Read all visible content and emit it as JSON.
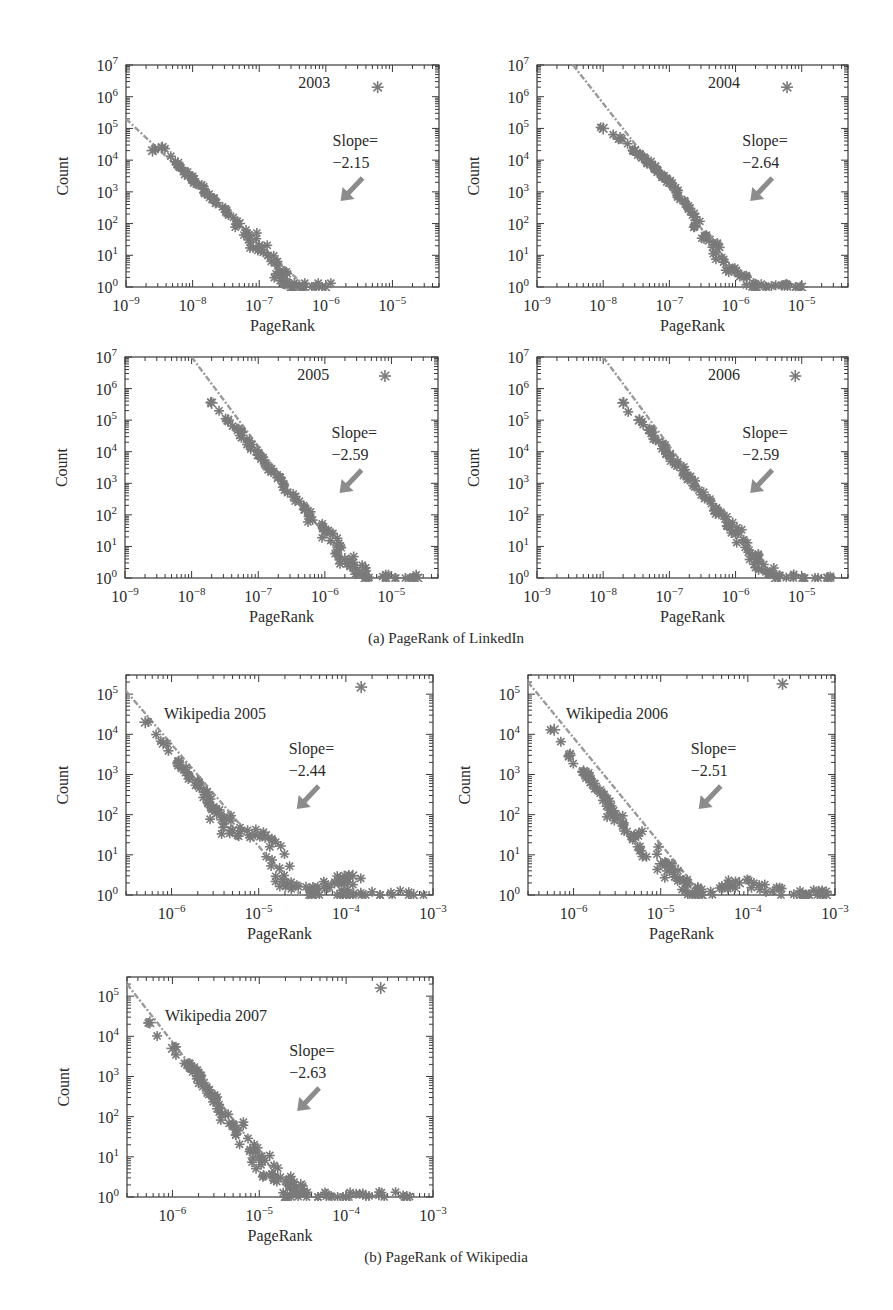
{
  "figure": {
    "captions": {
      "a": "(a) PageRank of LinkedIn",
      "b": "(b) PageRank of Wikipedia"
    },
    "colors": {
      "marker": "#7a7a7a",
      "fit_line": "#9a9a9a",
      "arrow": "#8c8c8c",
      "axis": "#3a3a3a",
      "text": "#2a2a2a"
    }
  },
  "chart_data": [
    {
      "type": "scatter",
      "title": "2003",
      "group": "LinkedIn",
      "xlabel": "PageRank",
      "ylabel": "Count",
      "xscale": "log",
      "yscale": "log",
      "xlim": [
        1e-09,
        5e-05
      ],
      "ylim": [
        1,
        10000000.0
      ],
      "xticks": [
        "10^-9",
        "10^-8",
        "10^-7",
        "10^-6",
        "10^-5"
      ],
      "yticks": [
        "10^0",
        "10^1",
        "10^2",
        "10^3",
        "10^4",
        "10^5",
        "10^6",
        "10^7"
      ],
      "annotation": {
        "label": "Slope=",
        "value": "−2.15"
      },
      "slope": -2.15,
      "fit_line": {
        "x0": 1e-09,
        "y0": 200000.0,
        "x1": 5e-07,
        "y1": 1
      },
      "outlier": {
        "x": 6e-06,
        "y": 2000000.0
      },
      "points": [
        [
          2.5e-09,
          20000.0
        ],
        [
          3.5e-09,
          25000.0
        ],
        [
          6e-09,
          8000.0
        ],
        [
          1e-08,
          2500.0
        ],
        [
          2e-08,
          600.0
        ],
        [
          5e-08,
          100.0
        ],
        [
          1e-07,
          20.0
        ],
        [
          2e-07,
          3
        ],
        [
          3e-07,
          1
        ],
        [
          1e-06,
          1
        ]
      ]
    },
    {
      "type": "scatter",
      "title": "2004",
      "group": "LinkedIn",
      "xlabel": "PageRank",
      "ylabel": "Count",
      "xscale": "log",
      "yscale": "log",
      "xlim": [
        1e-09,
        5e-05
      ],
      "ylim": [
        1,
        10000000.0
      ],
      "xticks": [
        "10^-9",
        "10^-8",
        "10^-7",
        "10^-6",
        "10^-5"
      ],
      "yticks": [
        "10^0",
        "10^1",
        "10^2",
        "10^3",
        "10^4",
        "10^5",
        "10^6",
        "10^7"
      ],
      "annotation": {
        "label": "Slope=",
        "value": "−2.64"
      },
      "slope": -2.64,
      "fit_line": {
        "x0": 3.5e-09,
        "y0": 10000000.0,
        "x1": 1.5e-06,
        "y1": 1
      },
      "outlier": {
        "x": 6e-06,
        "y": 2000000.0
      },
      "points": [
        [
          1e-08,
          100000.0
        ],
        [
          1.8e-08,
          50000.0
        ],
        [
          3e-08,
          20000.0
        ],
        [
          6e-08,
          6000.0
        ],
        [
          1e-07,
          2000.0
        ],
        [
          2e-07,
          300.0
        ],
        [
          4e-07,
          30.0
        ],
        [
          8e-07,
          4
        ],
        [
          2e-06,
          1
        ],
        [
          1e-05,
          1
        ]
      ]
    },
    {
      "type": "scatter",
      "title": "2005",
      "group": "LinkedIn",
      "xlabel": "PageRank",
      "ylabel": "Count",
      "xscale": "log",
      "yscale": "log",
      "xlim": [
        1e-09,
        5e-05
      ],
      "ylim": [
        1,
        10000000.0
      ],
      "xticks": [
        "10^-9",
        "10^-8",
        "10^-7",
        "10^-6",
        "10^-5"
      ],
      "yticks": [
        "10^0",
        "10^1",
        "10^2",
        "10^3",
        "10^4",
        "10^5",
        "10^6",
        "10^7"
      ],
      "annotation": {
        "label": "Slope=",
        "value": "−2.59"
      },
      "slope": -2.59,
      "fit_line": {
        "x0": 1e-08,
        "y0": 10000000.0,
        "x1": 3e-06,
        "y1": 1
      },
      "outlier": {
        "x": 8e-06,
        "y": 2500000.0
      },
      "points": [
        [
          2e-08,
          350000.0
        ],
        [
          3.5e-08,
          100000.0
        ],
        [
          5e-08,
          50000.0
        ],
        [
          1e-07,
          8000.0
        ],
        [
          2e-07,
          1500.0
        ],
        [
          5e-07,
          150.0
        ],
        [
          1e-06,
          30.0
        ],
        [
          2e-06,
          4
        ],
        [
          4e-06,
          1
        ],
        [
          2.5e-05,
          1
        ]
      ]
    },
    {
      "type": "scatter",
      "title": "2006",
      "group": "LinkedIn",
      "xlabel": "PageRank",
      "ylabel": "Count",
      "xscale": "log",
      "yscale": "log",
      "xlim": [
        1e-09,
        5e-05
      ],
      "ylim": [
        1,
        10000000.0
      ],
      "xticks": [
        "10^-9",
        "10^-8",
        "10^-7",
        "10^-6",
        "10^-5"
      ],
      "yticks": [
        "10^0",
        "10^1",
        "10^2",
        "10^3",
        "10^4",
        "10^5",
        "10^6",
        "10^7"
      ],
      "annotation": {
        "label": "Slope=",
        "value": "−2.59"
      },
      "slope": -2.59,
      "fit_line": {
        "x0": 1e-08,
        "y0": 10000000.0,
        "x1": 3e-06,
        "y1": 1
      },
      "outlier": {
        "x": 8e-06,
        "y": 2500000.0
      },
      "points": [
        [
          2e-08,
          350000.0
        ],
        [
          3.5e-08,
          100000.0
        ],
        [
          5e-08,
          50000.0
        ],
        [
          1e-07,
          8000.0
        ],
        [
          2e-07,
          1500.0
        ],
        [
          5e-07,
          150.0
        ],
        [
          1e-06,
          30.0
        ],
        [
          2e-06,
          4
        ],
        [
          4e-06,
          1
        ],
        [
          2.5e-05,
          1
        ]
      ]
    },
    {
      "type": "scatter",
      "title": "Wikipedia 2005",
      "group": "Wikipedia",
      "xlabel": "PageRank",
      "ylabel": "Count",
      "xscale": "log",
      "yscale": "log",
      "xlim": [
        3e-07,
        0.001
      ],
      "ylim": [
        1,
        300000.0
      ],
      "xticks": [
        "10^-6",
        "10^-5",
        "10^-4",
        "10^-3"
      ],
      "yticks": [
        "10^0",
        "10^1",
        "10^2",
        "10^3",
        "10^4",
        "10^5"
      ],
      "annotation": {
        "label": "Slope=",
        "value": "−2.44"
      },
      "slope": -2.44,
      "fit_line": {
        "x0": 3e-07,
        "y0": 120000.0,
        "x1": 3e-05,
        "y1": 1
      },
      "outlier": {
        "x": 0.00015,
        "y": 150000.0
      },
      "points": [
        [
          5e-07,
          20000.0
        ],
        [
          8e-07,
          6000.0
        ],
        [
          1.2e-06,
          2000.0
        ],
        [
          2e-06,
          600.0
        ],
        [
          3e-06,
          150.0
        ],
        [
          5e-06,
          40.0
        ],
        [
          1.2e-05,
          30.0
        ],
        [
          2e-05,
          2
        ],
        [
          4e-05,
          1
        ],
        [
          0.00012,
          3
        ],
        [
          0.0001,
          1
        ],
        [
          0.0006,
          1
        ]
      ]
    },
    {
      "type": "scatter",
      "title": "Wikipedia 2006",
      "group": "Wikipedia",
      "xlabel": "PageRank",
      "ylabel": "Count",
      "xscale": "log",
      "yscale": "log",
      "xlim": [
        3e-07,
        0.001
      ],
      "ylim": [
        1,
        300000.0
      ],
      "xticks": [
        "10^-6",
        "10^-5",
        "10^-4",
        "10^-3"
      ],
      "yticks": [
        "10^0",
        "10^1",
        "10^2",
        "10^3",
        "10^4",
        "10^5"
      ],
      "annotation": {
        "label": "Slope=",
        "value": "−2.51"
      },
      "slope": -2.51,
      "fit_line": {
        "x0": 3e-07,
        "y0": 200000.0,
        "x1": 3e-05,
        "y1": 1
      },
      "outlier": {
        "x": 0.00025,
        "y": 180000.0
      },
      "points": [
        [
          6e-07,
          13000.0
        ],
        [
          9e-07,
          3000.0
        ],
        [
          1.3e-06,
          1200.0
        ],
        [
          2e-06,
          400.0
        ],
        [
          3e-06,
          100.0
        ],
        [
          5e-06,
          30.0
        ],
        [
          1e-05,
          6
        ],
        [
          2e-05,
          2
        ],
        [
          3e-05,
          1
        ],
        [
          8e-05,
          2
        ],
        [
          0.0004,
          1
        ],
        [
          0.0008,
          1
        ]
      ]
    },
    {
      "type": "scatter",
      "title": "Wikipedia 2007",
      "group": "Wikipedia",
      "xlabel": "PageRank",
      "ylabel": "Count",
      "xscale": "log",
      "yscale": "log",
      "xlim": [
        3e-07,
        0.001
      ],
      "ylim": [
        1,
        300000.0
      ],
      "xticks": [
        "10^-6",
        "10^-5",
        "10^-4",
        "10^-3"
      ],
      "yticks": [
        "10^0",
        "10^1",
        "10^2",
        "10^3",
        "10^4",
        "10^5"
      ],
      "annotation": {
        "label": "Slope=",
        "value": "−2.63"
      },
      "slope": -2.63,
      "fit_line": {
        "x0": 3e-07,
        "y0": 200000.0,
        "x1": 2.5e-05,
        "y1": 1
      },
      "outlier": {
        "x": 0.00025,
        "y": 160000.0
      },
      "points": [
        [
          5.5e-07,
          22000.0
        ],
        [
          1e-06,
          5000.0
        ],
        [
          1.5e-06,
          2000.0
        ],
        [
          2e-06,
          1000.0
        ],
        [
          3e-06,
          300.0
        ],
        [
          5e-06,
          60.0
        ],
        [
          1e-05,
          10.0
        ],
        [
          1.5e-05,
          3
        ],
        [
          3e-05,
          2
        ],
        [
          2e-05,
          1
        ],
        [
          0.0001,
          1
        ],
        [
          0.0005,
          1
        ]
      ]
    }
  ]
}
